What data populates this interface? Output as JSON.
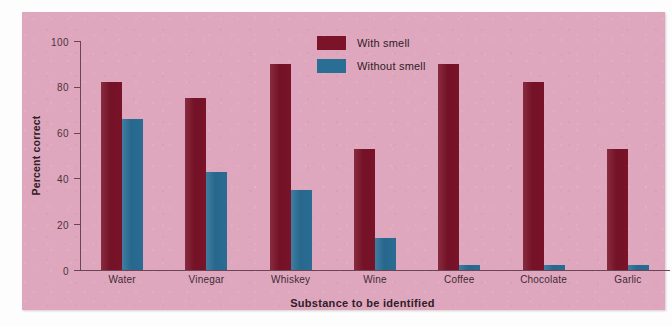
{
  "chart_data": {
    "type": "bar",
    "title": "",
    "xlabel": "Substance to be identified",
    "ylabel": "Percent correct",
    "categories": [
      "Water",
      "Vinegar",
      "Whiskey",
      "Wine",
      "Coffee",
      "Chocolate",
      "Garlic"
    ],
    "series": [
      {
        "name": "With smell",
        "color": "#7b1329",
        "values": [
          82,
          75,
          90,
          53,
          90,
          82,
          53
        ]
      },
      {
        "name": "Without smell",
        "color": "#2a6e96",
        "values": [
          66,
          43,
          35,
          14,
          2,
          2,
          2
        ]
      }
    ],
    "ylim": [
      0,
      100
    ],
    "yticks": [
      0,
      20,
      40,
      60,
      80,
      100
    ],
    "ytick_labels": [
      "0",
      "20",
      "40",
      "60",
      "80",
      "100"
    ],
    "grid": false,
    "legend_position": "top-center",
    "background_color": "#dfa7bd"
  }
}
